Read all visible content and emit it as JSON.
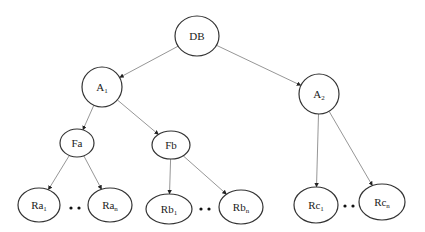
{
  "diagram": {
    "type": "tree",
    "nodes": [
      {
        "id": "DB",
        "label": "DB",
        "sub": "",
        "cx": 197,
        "cy": 36,
        "rx": 22,
        "ry": 20
      },
      {
        "id": "A1",
        "label": "A",
        "sub": "1",
        "cx": 102,
        "cy": 87,
        "rx": 20,
        "ry": 20
      },
      {
        "id": "A2",
        "label": "A",
        "sub": "2",
        "cx": 319,
        "cy": 94,
        "rx": 20,
        "ry": 20
      },
      {
        "id": "Fa",
        "label": "Fa",
        "sub": "",
        "cx": 77,
        "cy": 143,
        "rx": 17,
        "ry": 14
      },
      {
        "id": "Fb",
        "label": "Fb",
        "sub": "",
        "cx": 171,
        "cy": 145,
        "rx": 19,
        "ry": 14
      },
      {
        "id": "Ra1",
        "label": "Ra",
        "sub": "1",
        "cx": 39,
        "cy": 205,
        "rx": 21,
        "ry": 17
      },
      {
        "id": "Ran",
        "label": "Ra",
        "sub": "n",
        "cx": 110,
        "cy": 205,
        "rx": 22,
        "ry": 17
      },
      {
        "id": "Rb1",
        "label": "Rb",
        "sub": "1",
        "cx": 169,
        "cy": 209,
        "rx": 23,
        "ry": 15
      },
      {
        "id": "Rbn",
        "label": "Rb",
        "sub": "n",
        "cx": 241,
        "cy": 207,
        "rx": 22,
        "ry": 17
      },
      {
        "id": "Rc1",
        "label": "Rc",
        "sub": "1",
        "cx": 316,
        "cy": 205,
        "rx": 22,
        "ry": 18
      },
      {
        "id": "Rcn",
        "label": "Rc",
        "sub": "n",
        "cx": 382,
        "cy": 202,
        "rx": 23,
        "ry": 18
      }
    ],
    "edges": [
      {
        "from": "DB",
        "to": "A1"
      },
      {
        "from": "DB",
        "to": "A2"
      },
      {
        "from": "A1",
        "to": "Fa"
      },
      {
        "from": "A1",
        "to": "Fb"
      },
      {
        "from": "Fa",
        "to": "Ra1"
      },
      {
        "from": "Fa",
        "to": "Ran"
      },
      {
        "from": "Fb",
        "to": "Rb1"
      },
      {
        "from": "Fb",
        "to": "Rbn"
      },
      {
        "from": "A2",
        "to": "Rc1"
      },
      {
        "from": "A2",
        "to": "Rcn"
      }
    ],
    "ellipsis_marks": [
      {
        "between": [
          "Ra1",
          "Ran"
        ],
        "text": "• •",
        "x": 75,
        "y": 208
      },
      {
        "between": [
          "Rb1",
          "Rbn"
        ],
        "text": "• •",
        "x": 205,
        "y": 209
      },
      {
        "between": [
          "Rc1",
          "Rcn"
        ],
        "text": "• •",
        "x": 349,
        "y": 206
      }
    ],
    "colors": {
      "node_stroke": "#333333",
      "edge": "#8a8a8a",
      "text": "#222222",
      "background": "#ffffff"
    }
  }
}
